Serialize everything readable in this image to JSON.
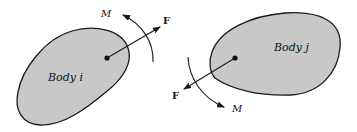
{
  "diagram": {
    "type": "free-body / joint reaction diagram",
    "colors": {
      "body_fill": "#c8c8c8",
      "outline": "#1a1a1a",
      "background": "#ffffff"
    },
    "body_i": {
      "label": "Body i",
      "force_label": "F",
      "moment_label": "M"
    },
    "body_j": {
      "label": "Body j",
      "force_label": "F",
      "moment_label": "M"
    }
  }
}
